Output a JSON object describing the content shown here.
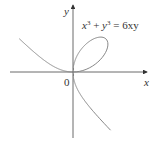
{
  "figure": {
    "equation_lhs_x": "x",
    "equation_exp1": "3",
    "equation_plus": " + ",
    "equation_lhs_y": "y",
    "equation_exp2": "3",
    "equation_rhs": " = 6xy",
    "axis_x_label": "x",
    "axis_y_label": "y",
    "origin_label": "0",
    "curve_name": "folium-of-descartes",
    "colors": {
      "curve": "#888888",
      "axes": "#444444",
      "text": "#333333"
    }
  }
}
